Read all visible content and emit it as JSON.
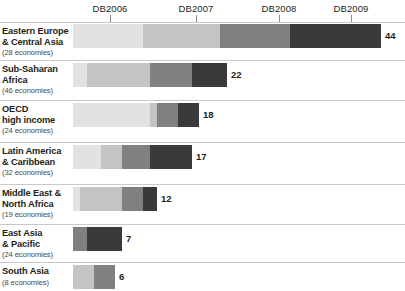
{
  "chart_data": {
    "type": "bar",
    "orientation": "horizontal",
    "stacked": true,
    "title": "",
    "subtitle": "",
    "xlabel": "",
    "ylabel": "",
    "grid": false,
    "legend_position": "top-axis",
    "axis": {
      "ticks": [
        {
          "label": "DB2006",
          "x_px": 110,
          "value": 10.5
        },
        {
          "label": "DB2007",
          "x_px": 196,
          "value": 21.0
        },
        {
          "label": "DB2008",
          "x_px": 279,
          "value": 31.0
        },
        {
          "label": "DB2009",
          "x_px": 351,
          "value": 39.5
        }
      ],
      "xlim": [
        0,
        44
      ],
      "origin_px": 73,
      "px_per_unit": 7.0
    },
    "series": [
      {
        "name": "DB2006",
        "color": "#e2e2e2"
      },
      {
        "name": "DB2007",
        "color": "#c4c4c4"
      },
      {
        "name": "DB2008",
        "color": "#808080"
      },
      {
        "name": "DB2009",
        "color": "#3a3a3a"
      }
    ],
    "categories": [
      "Eastern Europe & Central Asia",
      "Sub-Saharan Africa",
      "OECD high income",
      "Latin America & Caribbean",
      "Middle East & North Africa",
      "East Asia & Pacific",
      "South Asia"
    ],
    "totals": [
      44,
      22,
      18,
      17,
      12,
      7,
      6
    ],
    "segment_values": [
      [
        10,
        11,
        10,
        13
      ],
      [
        2,
        9,
        6,
        5
      ],
      [
        11,
        1,
        3,
        3
      ],
      [
        4,
        3,
        4,
        6
      ],
      [
        1,
        6,
        3,
        2
      ],
      [
        0,
        0,
        2,
        5
      ],
      [
        0,
        3,
        3,
        0
      ]
    ]
  },
  "topnote": "",
  "rows": [
    {
      "name": "eastern-europe-central-asia",
      "label_line1": "Eastern Europe",
      "label_line2": "& Central Asia",
      "economies": "(28 economies)",
      "total": "44",
      "segments": [
        10,
        11,
        10,
        13
      ]
    },
    {
      "name": "sub-saharan-africa",
      "label_line1": "Sub-Saharan",
      "label_line2": "Africa",
      "economies": "(46 economies)",
      "total": "22",
      "segments": [
        2,
        9,
        6,
        5
      ]
    },
    {
      "name": "oecd-high-income",
      "label_line1": "OECD",
      "label_line2": "high income",
      "economies": "(24 economies)",
      "total": "18",
      "segments": [
        11,
        1,
        3,
        3
      ]
    },
    {
      "name": "latin-america-caribbean",
      "label_line1": "Latin America",
      "label_line2": "& Caribbean",
      "economies": "(32 economies)",
      "total": "17",
      "segments": [
        4,
        3,
        4,
        6
      ]
    },
    {
      "name": "middle-east-north-africa",
      "label_line1": "Middle East &",
      "label_line2": "North Africa",
      "economies": "(19 economies)",
      "total": "12",
      "segments": [
        1,
        6,
        3,
        2
      ]
    },
    {
      "name": "east-asia-pacific",
      "label_line1": "East Asia",
      "label_line2": "& Pacific",
      "economies": "(24 economies)",
      "total": "7",
      "segments": [
        0,
        0,
        2,
        5
      ]
    },
    {
      "name": "south-asia",
      "label_line1": "South Asia",
      "label_line2": "",
      "economies": "(8 economies)",
      "total": "6",
      "segments": [
        0,
        3,
        3,
        0
      ]
    }
  ]
}
